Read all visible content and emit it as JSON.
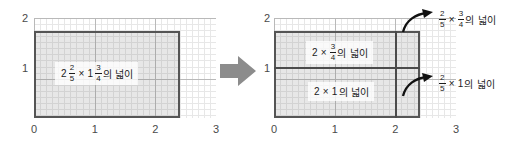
{
  "figure": {
    "type": "math-area-model"
  },
  "left_panel": {
    "axis": {
      "x_ticks": [
        "0",
        "1",
        "2",
        "3"
      ],
      "y_ticks": [
        "1",
        "2"
      ],
      "x_range": [
        0,
        3
      ],
      "y_range": [
        0,
        2
      ],
      "grid": "on",
      "unit_subdivisions": 10
    },
    "rectangle": {
      "width_units": 2.4,
      "height_units": 1.75
    },
    "label": {
      "whole1": "2",
      "frac1_num": "2",
      "frac1_den": "5",
      "times": "×",
      "whole2": "1",
      "frac2_num": "3",
      "frac2_den": "4",
      "suffix": "의 넓이"
    }
  },
  "transform_arrow": {
    "icon": "block-arrow-right",
    "color": "#8c8c8c"
  },
  "right_panel": {
    "axis": {
      "x_ticks": [
        "0",
        "1",
        "2",
        "3"
      ],
      "y_ticks": [
        "1",
        "2"
      ],
      "x_range": [
        0,
        3
      ],
      "y_range": [
        0,
        2
      ],
      "grid": "on",
      "unit_subdivisions": 10
    },
    "rectangle": {
      "width_units": 2.4,
      "height_units": 1.75,
      "split_x": 2,
      "split_y": 1
    },
    "inner_labels": [
      {
        "whole1": "2",
        "times": "×",
        "frac_num": "3",
        "frac_den": "4",
        "suffix": "의 넓이"
      },
      {
        "whole1": "2",
        "times": "×",
        "whole2": "1",
        "suffix": "의 넓이"
      }
    ],
    "callouts": [
      {
        "arrow": "curved-arrow-up-right",
        "frac1_num": "2",
        "frac1_den": "5",
        "times": "×",
        "frac2_num": "3",
        "frac2_den": "4",
        "suffix": "의 넓이"
      },
      {
        "arrow": "curved-arrow-up-right",
        "frac1_num": "2",
        "frac1_den": "5",
        "times": "×",
        "whole2": "1",
        "suffix": "의 넓이"
      }
    ]
  },
  "colors": {
    "shade": "#cccccc",
    "border": "#555555",
    "grid_major": "#b9b9b9",
    "grid_fine": "#e3e3e3",
    "text": "#1c1c1c",
    "tick": "#4a4a4a",
    "arrow": "#8c8c8c"
  }
}
